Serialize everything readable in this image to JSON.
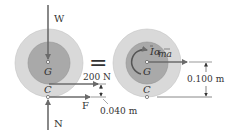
{
  "diagram": {
    "left_fbd": {
      "weight_label": "W",
      "center_label": "G",
      "contact_label": "C",
      "normal_label": "N",
      "friction_label": "F",
      "applied_force_label": "200 N",
      "offset_dimension": "0.040 m"
    },
    "equals_sign": "=",
    "right_kd": {
      "center_label": "G",
      "contact_label": "C",
      "inertia_label": "Iα",
      "inertia_label_I": "I",
      "inertia_label_alpha": "α",
      "ma_label": "ma",
      "height_dimension": "0.100 m"
    },
    "colors": {
      "outer_disc": "#d9d9d9",
      "inner_disc": "#a9a9a9",
      "arrow": "#6b6b6b",
      "text": "#333333",
      "background": "#ffffff"
    }
  }
}
